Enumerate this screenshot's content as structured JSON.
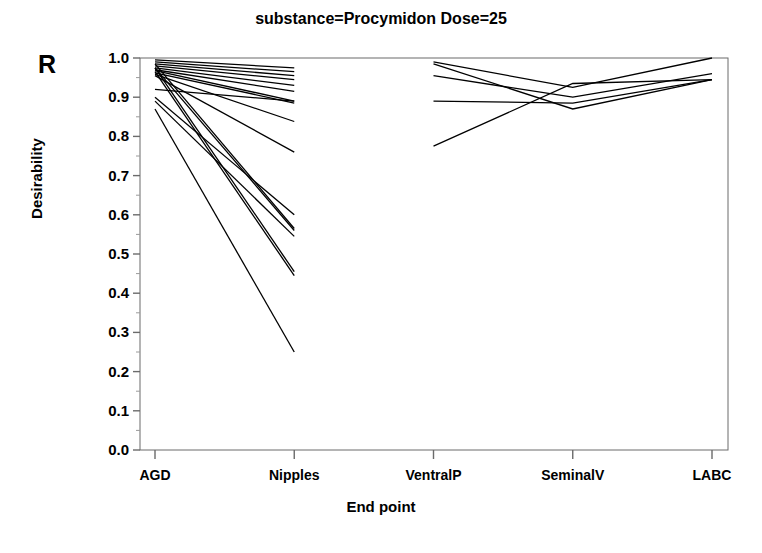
{
  "chart_data": {
    "type": "line",
    "title": "substance=Procymidon  Dose=25",
    "xlabel": "End point",
    "ylabel": "Desirability",
    "annotation": "R",
    "categories": [
      "AGD",
      "Nipples",
      "VentralP",
      "SeminalV",
      "LABC"
    ],
    "yticks": [
      "1.0",
      "0.9",
      "0.8",
      "0.7",
      "0.6",
      "0.5",
      "0.4",
      "0.3",
      "0.2",
      "0.1",
      "0.0"
    ],
    "ylim": [
      0.0,
      1.0
    ],
    "grid": false,
    "legend": "none",
    "line_color": "#000000",
    "panels": [
      {
        "name": "left-panel",
        "categories": [
          "AGD",
          "Nipples"
        ]
      },
      {
        "name": "right-panel",
        "categories": [
          "VentralP",
          "SeminalV",
          "LABC"
        ]
      }
    ],
    "series": [
      {
        "name": "profile-01",
        "x": [
          "AGD",
          "Nipples"
        ],
        "values": [
          0.995,
          0.975
        ]
      },
      {
        "name": "profile-02",
        "x": [
          "AGD",
          "Nipples"
        ],
        "values": [
          0.99,
          0.965
        ]
      },
      {
        "name": "profile-03",
        "x": [
          "AGD",
          "Nipples"
        ],
        "values": [
          0.985,
          0.955
        ]
      },
      {
        "name": "profile-04",
        "x": [
          "AGD",
          "Nipples"
        ],
        "values": [
          0.98,
          0.945
        ]
      },
      {
        "name": "profile-05",
        "x": [
          "AGD",
          "Nipples"
        ],
        "values": [
          0.975,
          0.93
        ]
      },
      {
        "name": "profile-06",
        "x": [
          "AGD",
          "Nipples"
        ],
        "values": [
          0.97,
          0.915
        ]
      },
      {
        "name": "profile-07",
        "x": [
          "AGD",
          "Nipples"
        ],
        "values": [
          0.968,
          0.89
        ]
      },
      {
        "name": "profile-08",
        "x": [
          "AGD",
          "Nipples"
        ],
        "values": [
          0.962,
          0.885
        ]
      },
      {
        "name": "profile-09",
        "x": [
          "AGD",
          "Nipples"
        ],
        "values": [
          0.958,
          0.838
        ]
      },
      {
        "name": "profile-10",
        "x": [
          "AGD",
          "Nipples"
        ],
        "values": [
          0.92,
          0.89
        ]
      },
      {
        "name": "profile-11",
        "x": [
          "AGD",
          "Nipples"
        ],
        "values": [
          0.955,
          0.76
        ]
      },
      {
        "name": "profile-12",
        "x": [
          "AGD",
          "Nipples"
        ],
        "values": [
          0.9,
          0.6
        ]
      },
      {
        "name": "profile-13",
        "x": [
          "AGD",
          "Nipples"
        ],
        "values": [
          0.985,
          0.565
        ]
      },
      {
        "name": "profile-14",
        "x": [
          "AGD",
          "Nipples"
        ],
        "values": [
          0.975,
          0.56
        ]
      },
      {
        "name": "profile-15",
        "x": [
          "AGD",
          "Nipples"
        ],
        "values": [
          0.89,
          0.545
        ]
      },
      {
        "name": "profile-16",
        "x": [
          "AGD",
          "Nipples"
        ],
        "values": [
          0.975,
          0.455
        ]
      },
      {
        "name": "profile-17",
        "x": [
          "AGD",
          "Nipples"
        ],
        "values": [
          0.965,
          0.445
        ]
      },
      {
        "name": "profile-18",
        "x": [
          "AGD",
          "Nipples"
        ],
        "values": [
          0.87,
          0.25
        ]
      },
      {
        "name": "profile-19",
        "x": [
          "VentralP",
          "SeminalV",
          "LABC"
        ],
        "values": [
          0.99,
          0.925,
          1.0
        ]
      },
      {
        "name": "profile-20",
        "x": [
          "VentralP",
          "SeminalV",
          "LABC"
        ],
        "values": [
          0.985,
          0.87,
          0.945
        ]
      },
      {
        "name": "profile-21",
        "x": [
          "VentralP",
          "SeminalV",
          "LABC"
        ],
        "values": [
          0.955,
          0.9,
          0.96
        ]
      },
      {
        "name": "profile-22",
        "x": [
          "VentralP",
          "SeminalV",
          "LABC"
        ],
        "values": [
          0.89,
          0.885,
          0.945
        ]
      },
      {
        "name": "profile-23",
        "x": [
          "VentralP",
          "SeminalV",
          "LABC"
        ],
        "values": [
          0.775,
          0.935,
          0.945
        ]
      }
    ]
  }
}
